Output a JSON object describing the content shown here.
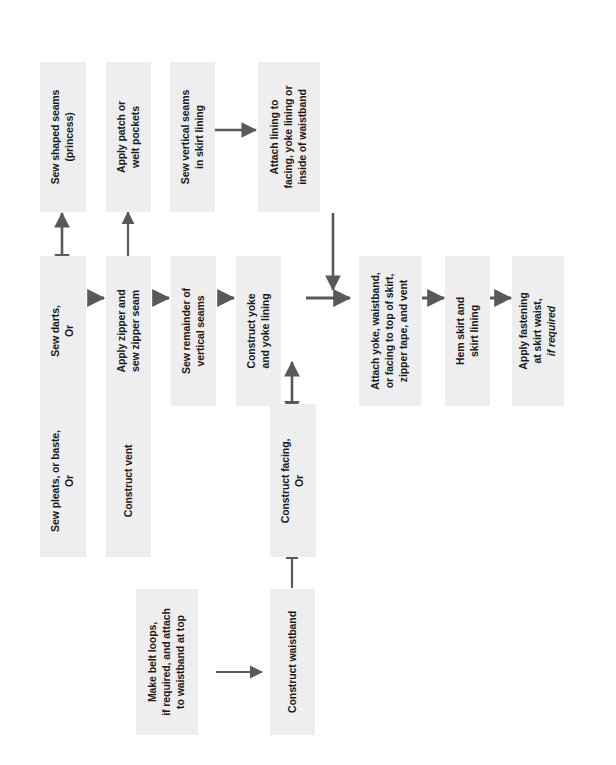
{
  "diagram": {
    "orientation": "rotated-90-ccw",
    "box_fill": "#eeeeee",
    "arrow_color": "#595959",
    "text_color": "#1a1a1a",
    "background": "#ffffff"
  },
  "nodes": {
    "sew_shaped_seams": {
      "line1": "Sew shaped seams",
      "line2": "(princess)"
    },
    "apply_patch_pockets": {
      "line1": "Apply patch or",
      "line2": "welt pockets"
    },
    "sew_vertical_seams_lining": {
      "line1": "Sew vertical seams",
      "line2": "in skirt lining"
    },
    "attach_lining": {
      "line1": "Attach lining to",
      "line2": "facing, yoke lining or",
      "line3": "inside of waistband"
    },
    "sew_darts": {
      "line1": "Sew darts,",
      "line2": "Or"
    },
    "apply_zipper": {
      "line1": "Apply zipper and",
      "line2": "sew zipper seam"
    },
    "sew_remainder_seams": {
      "line1": "Sew remainder of",
      "line2": "vertical seams"
    },
    "construct_yoke": {
      "line1": "Construct yoke",
      "line2": "and yoke lining"
    },
    "attach_yoke_waistband": {
      "line1": "Attach yoke, waistband,",
      "line2": "or facing to top of skirt,",
      "line3": "zipper tape, and vent"
    },
    "hem_skirt": {
      "line1": "Hem skirt and",
      "line2": "skirt lining"
    },
    "apply_fastening": {
      "line1": "Apply fastening",
      "line2": "at skirt waist,",
      "line3_italic": "if required"
    },
    "sew_pleats": {
      "line1": "Sew pleats, or baste,",
      "line2": "Or"
    },
    "construct_vent": {
      "line1": "Construct vent"
    },
    "construct_facing": {
      "line1": "Construct facing,",
      "line2": "Or"
    },
    "make_belt_loops": {
      "line1": "Make belt loops,",
      "line2": "if required, and attach",
      "line3": "to waistband at top"
    },
    "construct_waistband": {
      "line1": "Construct waistband"
    }
  }
}
